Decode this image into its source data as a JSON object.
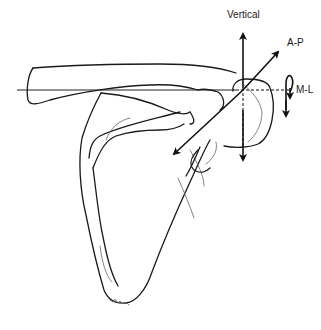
{
  "figure": {
    "labels": {
      "vertical": "Vertical",
      "ap": "A-P",
      "ml": "M-L"
    },
    "axes": [
      {
        "name": "Vertical",
        "direction": "up-down",
        "bidirectional": true
      },
      {
        "name": "A-P",
        "direction": "diagonal",
        "bidirectional": true
      },
      {
        "name": "M-L",
        "direction": "horizontal",
        "rotation_arrow": true
      }
    ],
    "colors": {
      "line": "#1a1a1a",
      "background": "#ffffff"
    }
  }
}
